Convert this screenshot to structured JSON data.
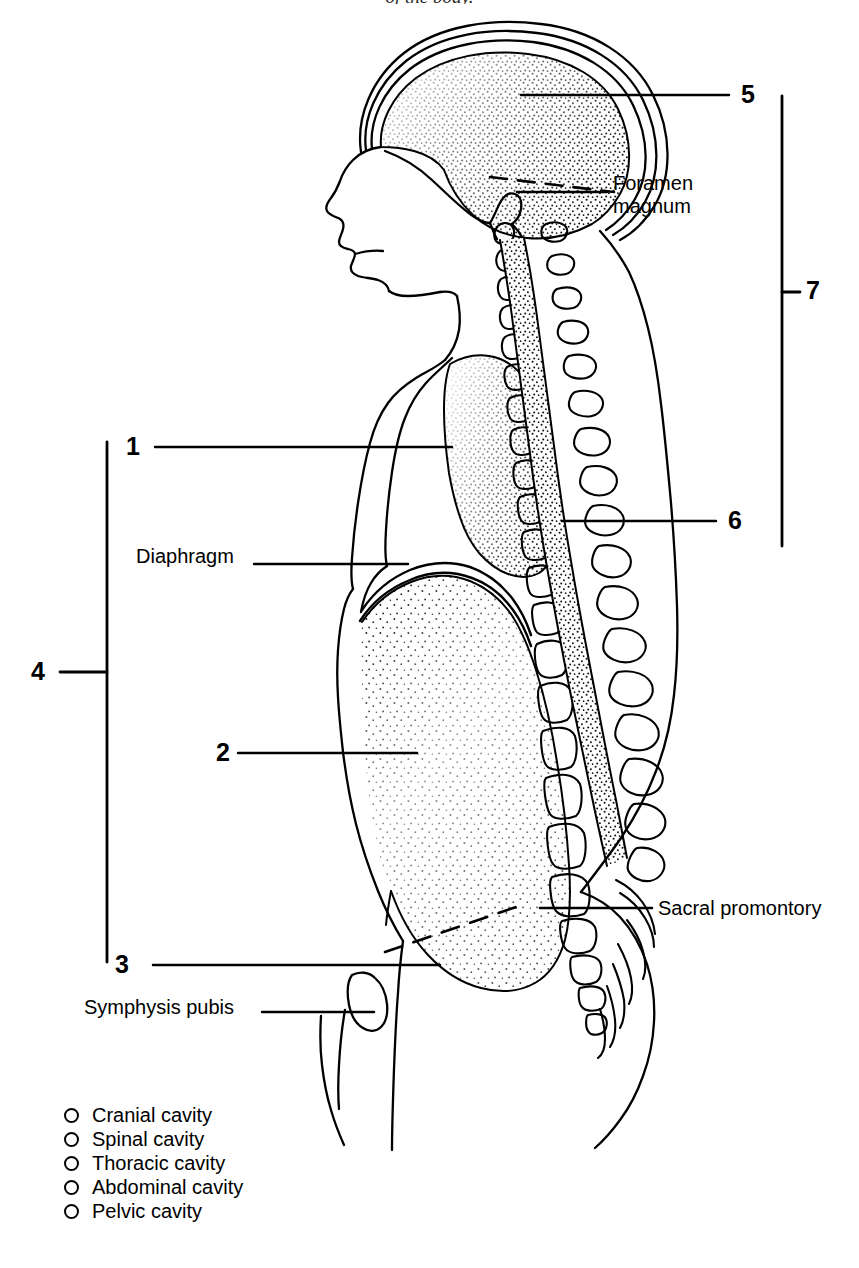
{
  "figure": {
    "header_text": "of the body.",
    "title_note": "Sagittal section of the human body showing the dorsal and ventral body cavities"
  },
  "numbered_labels": [
    {
      "id": "1",
      "text": "1",
      "x": 126,
      "y": 434,
      "cavity": "Thoracic cavity"
    },
    {
      "id": "2",
      "text": "2",
      "x": 216,
      "y": 740,
      "cavity": "Abdominal cavity"
    },
    {
      "id": "3",
      "text": "3",
      "x": 115,
      "y": 952,
      "cavity": "Pelvic cavity"
    },
    {
      "id": "4",
      "text": "4",
      "x": 31,
      "y": 659,
      "cavity": "Ventral body cavity"
    },
    {
      "id": "5",
      "text": "5",
      "x": 741,
      "y": 82,
      "cavity": "Cranial cavity"
    },
    {
      "id": "6",
      "text": "6",
      "x": 728,
      "y": 508,
      "cavity": "Spinal cavity"
    },
    {
      "id": "7",
      "text": "7",
      "x": 806,
      "y": 278,
      "cavity": "Dorsal body cavity"
    }
  ],
  "text_labels": [
    {
      "id": "foramen-magnum",
      "text": "Foramen\nmagnum",
      "x": 613,
      "y": 172
    },
    {
      "id": "diaphragm",
      "text": "Diaphragm",
      "x": 136,
      "y": 545
    },
    {
      "id": "sacral-promontory",
      "text": "Sacral promontory",
      "x": 658,
      "y": 897
    },
    {
      "id": "symphysis-pubis",
      "text": "Symphysis pubis",
      "x": 84,
      "y": 996
    }
  ],
  "checklist": {
    "items": [
      {
        "label": "Cranial cavity",
        "checked": false
      },
      {
        "label": "Spinal cavity",
        "checked": false
      },
      {
        "label": "Thoracic cavity",
        "checked": false
      },
      {
        "label": "Abdominal cavity",
        "checked": false
      },
      {
        "label": "Pelvic cavity",
        "checked": false
      }
    ]
  },
  "colors": {
    "ink": "#000000",
    "paper": "#ffffff",
    "stipple": "#1a1a1a"
  }
}
